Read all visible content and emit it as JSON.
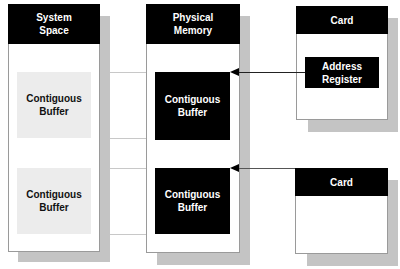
{
  "diagram": {
    "columns": [
      {
        "id": "system-space",
        "title_line1": "System",
        "title_line2": "Space"
      },
      {
        "id": "physical-memory",
        "title_line1": "Physical",
        "title_line2": "Memory"
      }
    ],
    "system_space": {
      "buffers": [
        {
          "line1": "Contiguous",
          "line2": "Buffer"
        },
        {
          "line1": "Contiguous",
          "line2": "Buffer"
        }
      ]
    },
    "physical_memory": {
      "buffers": [
        {
          "line1": "Contiguous",
          "line2": "Buffer"
        },
        {
          "line1": "Contiguous",
          "line2": "Buffer"
        }
      ]
    },
    "cards": [
      {
        "title": "Card",
        "register": {
          "line1": "Address",
          "line2": "Register"
        }
      },
      {
        "title": "Card"
      }
    ],
    "colors": {
      "header": "#000000",
      "light_buffer": "#ececec",
      "dark_buffer": "#000000",
      "shadow": "#c4c4c4",
      "mapping_line": "#c8c8c8",
      "arrow": "#000000"
    }
  }
}
